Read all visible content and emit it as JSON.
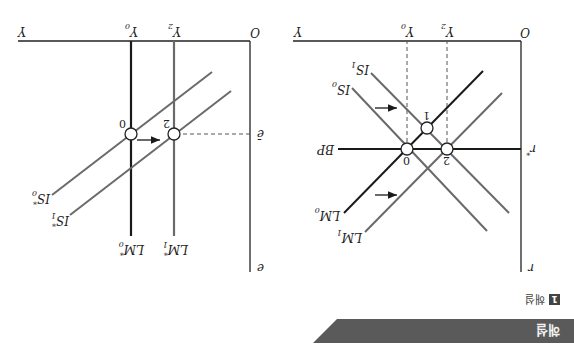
{
  "orientation": "rotated-180",
  "header": {
    "label": "해설"
  },
  "figure": {
    "number": "1",
    "label": "해설"
  },
  "colors": {
    "header_bg": "#5a5a5a",
    "axis": "#222222",
    "curve_dark": "#1a1a1a",
    "curve_gray": "#6a6a6a",
    "dash": "#555555"
  },
  "left_panel": {
    "axis_origin": "O",
    "y_axis_label": "r",
    "x_axis_label": "Y",
    "ticks": {
      "y": "r",
      "y_sub": "*",
      "x0": "Y",
      "x0_sub": "0",
      "x2": "Y",
      "x2_sub": "2"
    },
    "curves": {
      "bp": "BP",
      "is0": "IS",
      "is0_sub": "0",
      "is1": "IS",
      "is1_sub": "1",
      "lm0": "LM",
      "lm0_sub": "0",
      "lm1": "LM",
      "lm1_sub": "1"
    },
    "points": [
      "0",
      "1",
      "2"
    ]
  },
  "right_panel": {
    "axis_origin": "O",
    "y_axis_label": "e",
    "x_axis_label": "Y",
    "ticks": {
      "y": "ē",
      "x0": "Y",
      "x0_sub": "0",
      "x2": "Y",
      "x2_sub": "2"
    },
    "curves": {
      "is0": "IS",
      "is0_sub": "0",
      "is0_sup": "*",
      "is1": "IS",
      "is1_sub": "1",
      "is1_sup": "*",
      "lm0": "LM",
      "lm0_sub": "0",
      "lm0_sup": "*",
      "lm1": "LM",
      "lm1_sub": "1",
      "lm1_sup": "*"
    },
    "points": [
      "0",
      "2"
    ]
  }
}
